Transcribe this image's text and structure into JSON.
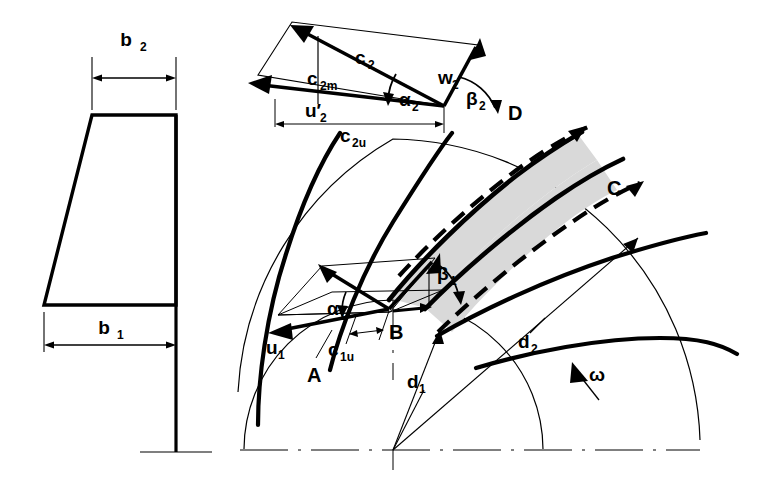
{
  "figure": {
    "type": "technical-diagram",
    "background_color": "#ffffff",
    "line_color": "#000000",
    "shaded_passage_color": "#d9d9d9"
  },
  "meridional_view": {
    "name": "impeller-meridional-section",
    "dim_b2": "b",
    "dim_b2_sub": "2",
    "dim_b1": "b",
    "dim_b1_sub": "1"
  },
  "outlet_triangle": {
    "c2": "c",
    "c2_sub": "2",
    "c2m": "c",
    "c2m_sub": "2m",
    "c2u": "c",
    "c2u_sub": "2u",
    "u2": "u′",
    "u2_sub": "2",
    "w2": "w",
    "w2_sub": "2",
    "alpha2": "α",
    "alpha2_sub": "2",
    "beta2": "β",
    "beta2_sub": "2"
  },
  "inlet_triangle": {
    "u1": "u",
    "u1_sub": "1",
    "c1u": "c",
    "c1u_sub": "1u",
    "alpha1": "α",
    "alpha1_sub": "1",
    "beta1": "β",
    "beta1_sub": "1"
  },
  "points": {
    "A": "A",
    "B": "B",
    "C": "C",
    "D": "D"
  },
  "diameters": {
    "d1": "d",
    "d1_sub": "1",
    "d2": "d",
    "d2_sub": "2"
  },
  "rotation": {
    "omega": "ω"
  }
}
